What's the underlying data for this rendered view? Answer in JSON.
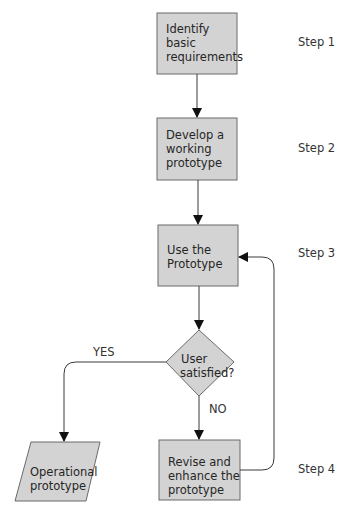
{
  "diagram": {
    "type": "flowchart",
    "title": "",
    "colors": {
      "node_fill": "#d3d3d3",
      "node_stroke": "#6b6b6b",
      "edge": "#3a3a3a"
    },
    "nodes": [
      {
        "id": "n1",
        "shape": "rect",
        "label": "Identify basic requirements",
        "lines": [
          "Identify",
          "basic",
          "requirements"
        ]
      },
      {
        "id": "n2",
        "shape": "rect",
        "label": "Develop a working prototype",
        "lines": [
          "Develop a",
          "working",
          "prototype"
        ]
      },
      {
        "id": "n3",
        "shape": "rect",
        "label": "Use the Prototype",
        "lines": [
          "Use the",
          "Prototype"
        ]
      },
      {
        "id": "n4",
        "shape": "diamond",
        "label": "User satisfied?",
        "lines": [
          "User",
          "satisfied?"
        ]
      },
      {
        "id": "n5",
        "shape": "parallelogram",
        "label": "Operational prototype",
        "lines": [
          "Operational",
          "prototype"
        ]
      },
      {
        "id": "n6",
        "shape": "rect",
        "label": "Revise and enhance the prototype",
        "lines": [
          "Revise and",
          "enhance the",
          "prototype"
        ]
      }
    ],
    "edges": [
      {
        "from": "n1",
        "to": "n2",
        "label": ""
      },
      {
        "from": "n2",
        "to": "n3",
        "label": ""
      },
      {
        "from": "n3",
        "to": "n4",
        "label": ""
      },
      {
        "from": "n4",
        "to": "n5",
        "label": "YES"
      },
      {
        "from": "n4",
        "to": "n6",
        "label": "NO"
      },
      {
        "from": "n6",
        "to": "n3",
        "label": ""
      }
    ],
    "step_labels": [
      "Step 1",
      "Step 2",
      "Step 3",
      "Step 4"
    ],
    "edge_labels": {
      "yes": "YES",
      "no": "NO"
    }
  }
}
